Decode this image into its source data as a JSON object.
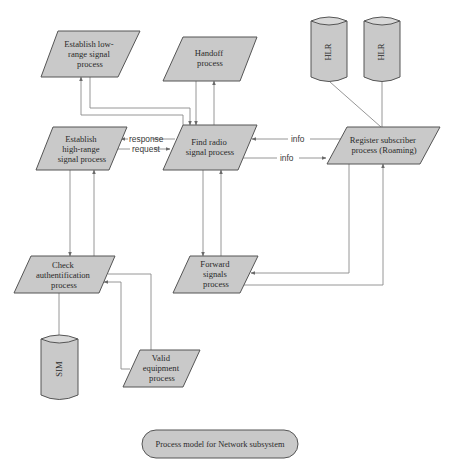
{
  "diagram": {
    "caption": "Process model for Network subsystem",
    "colors": {
      "shape_fill": "#c9c9c9",
      "shape_stroke": "#555555",
      "edge": "#8a8a8a",
      "background": "#ffffff"
    },
    "nodes": {
      "low_range": {
        "type": "parallelogram",
        "lines": [
          "Establish low-",
          "range signal",
          "process"
        ]
      },
      "handoff": {
        "type": "parallelogram",
        "lines": [
          "Handoff",
          "process"
        ]
      },
      "high_range": {
        "type": "parallelogram",
        "lines": [
          "Establish",
          "high-range",
          "signal process"
        ]
      },
      "find_radio": {
        "type": "parallelogram",
        "lines": [
          "Find radio",
          "signal process"
        ]
      },
      "register": {
        "type": "parallelogram",
        "lines": [
          "Register subscriber",
          "process (Roaming)"
        ]
      },
      "check_auth": {
        "type": "parallelogram",
        "lines": [
          "Check",
          "authentification",
          "process"
        ]
      },
      "forward": {
        "type": "parallelogram",
        "lines": [
          "Forward",
          "signals",
          "process"
        ]
      },
      "valid_equipment": {
        "type": "parallelogram",
        "lines": [
          "Valid",
          "equipment",
          "process"
        ]
      },
      "hlr_1": {
        "type": "datastore",
        "label": "HLR"
      },
      "hlr_2": {
        "type": "datastore",
        "label": "HLR"
      },
      "sim": {
        "type": "datastore",
        "label": "SIM"
      }
    },
    "edges": [
      {
        "from": "low_range",
        "to": "find_radio",
        "label": ""
      },
      {
        "from": "find_radio",
        "to": "low_range",
        "label": ""
      },
      {
        "from": "handoff",
        "to": "find_radio",
        "label": ""
      },
      {
        "from": "find_radio",
        "to": "handoff",
        "label": ""
      },
      {
        "from": "find_radio",
        "to": "high_range",
        "label": "response"
      },
      {
        "from": "high_range",
        "to": "find_radio",
        "label": "request"
      },
      {
        "from": "register",
        "to": "find_radio",
        "label": "info"
      },
      {
        "from": "find_radio",
        "to": "register",
        "label": "info"
      },
      {
        "from": "hlr_1",
        "to": "register",
        "label": ""
      },
      {
        "from": "hlr_2",
        "to": "register",
        "label": ""
      },
      {
        "from": "high_range",
        "to": "check_auth",
        "label": ""
      },
      {
        "from": "check_auth",
        "to": "high_range",
        "label": ""
      },
      {
        "from": "find_radio",
        "to": "forward",
        "label": ""
      },
      {
        "from": "forward",
        "to": "find_radio",
        "label": ""
      },
      {
        "from": "register",
        "to": "forward",
        "label": ""
      },
      {
        "from": "forward",
        "to": "register",
        "label": ""
      },
      {
        "from": "check_auth",
        "to": "sim",
        "label": ""
      },
      {
        "from": "check_auth",
        "to": "valid_equipment",
        "label": ""
      },
      {
        "from": "valid_equipment",
        "to": "check_auth",
        "label": ""
      }
    ],
    "edge_labels": {
      "response": "response",
      "request": "request",
      "info_in": "info",
      "info_out": "info"
    }
  }
}
